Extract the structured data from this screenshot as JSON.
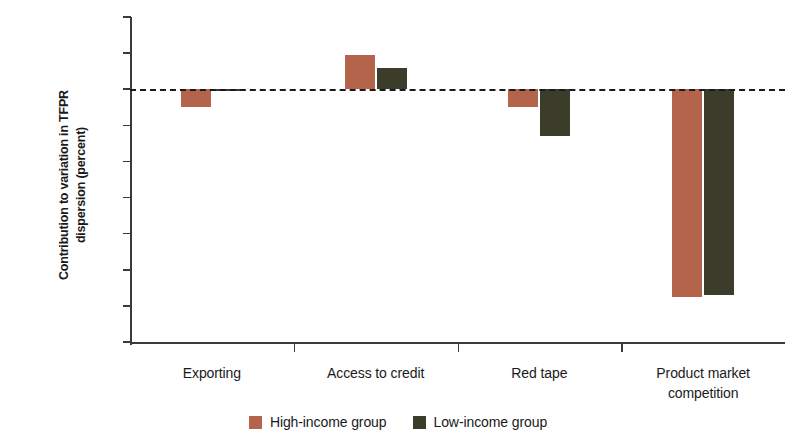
{
  "chart_data": {
    "type": "bar",
    "title": "",
    "subtitle": "",
    "xlabel": "",
    "ylabel": "Contribution to variation in TFPR\ndispersion (percent)",
    "categories": [
      "Exporting",
      "Access to credit",
      "Red tape",
      "Product market\ncompetition"
    ],
    "series": [
      {
        "name": "High-income group",
        "color": "#b5644c",
        "values": [
          -5.0,
          9.5,
          -5.0,
          -57.5
        ]
      },
      {
        "name": "Low-income group",
        "color": "#3c3c2a",
        "values": [
          -0.6,
          6.0,
          -13.0,
          -57.0
        ]
      }
    ],
    "ylim": [
      -70,
      20
    ],
    "yticks": [
      20,
      10,
      0,
      -10,
      -20,
      -30,
      -40,
      -50,
      -60,
      -70
    ],
    "ytick_labels": [
      "20",
      "10",
      "0",
      "−10",
      "−20",
      "−30",
      "−40",
      "−50",
      "−60",
      "−70"
    ],
    "grid": false,
    "zero_line": true,
    "zero_line_style": "dashed",
    "legend_position": "bottom-center"
  },
  "legend": {
    "items": [
      {
        "label": "High-income group",
        "color": "#b5644c"
      },
      {
        "label": "Low-income group",
        "color": "#3c3c2a"
      }
    ]
  }
}
